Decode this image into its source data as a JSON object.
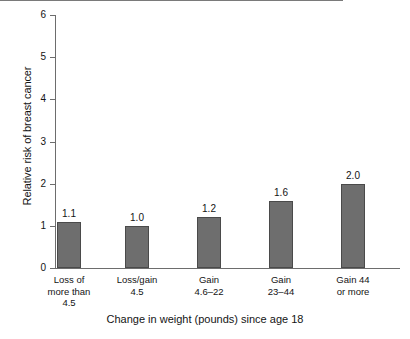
{
  "chart_data": {
    "type": "bar",
    "title": "",
    "xlabel": "Change in weight (pounds) since age 18",
    "ylabel": "Relative risk of breast cancer",
    "categories": [
      "Loss of more than 4.5",
      "Loss/gain 4.5",
      "Gain 4.6–22",
      "Gain 23–44",
      "Gain 44 or more"
    ],
    "category_lines": [
      [
        "Loss of",
        "more than",
        "4.5"
      ],
      [
        "Loss/gain",
        "4.5"
      ],
      [
        "Gain",
        "4.6–22"
      ],
      [
        "Gain",
        "23–44"
      ],
      [
        "Gain 44",
        "or more"
      ]
    ],
    "values": [
      1.1,
      1.0,
      1.2,
      1.6,
      2.0
    ],
    "value_labels": [
      "1.1",
      "1.0",
      "1.2",
      "1.6",
      "2.0"
    ],
    "ylim": [
      0,
      6
    ],
    "yticks": [
      0,
      1,
      2,
      3,
      4,
      5,
      6
    ],
    "ytick_labels": [
      "0",
      "1",
      "2",
      "3",
      "4",
      "5",
      "6"
    ],
    "grid": false,
    "legend": "none",
    "reference_line": {
      "value": 1,
      "label": "1"
    },
    "colors": {
      "bar_fill": "#6e6e6e",
      "bar_stroke": "#4a4a4a",
      "axis": "#6d6d6d",
      "text": "#141414",
      "background": "#ffffff"
    }
  }
}
